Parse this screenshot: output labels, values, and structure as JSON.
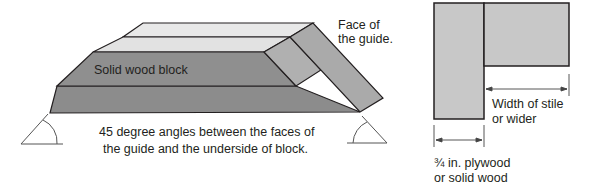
{
  "left_diagram": {
    "label_block": "Solid wood block",
    "label_face": [
      "Face of",
      "the guide."
    ],
    "caption": [
      "45 degree angles between the faces of",
      "the guide and the underside of block."
    ]
  },
  "right_diagram": {
    "label_width": [
      "Width of stile",
      "or wider"
    ],
    "label_thickness": [
      "¾ in. plywood",
      "or solid wood"
    ]
  },
  "colors": {
    "light_face": "#e6e6e6",
    "mid_face": "#a9a9a9",
    "dark_face": "#8c8c8c",
    "panel": "#c8c8c8",
    "stroke": "#231f20"
  }
}
